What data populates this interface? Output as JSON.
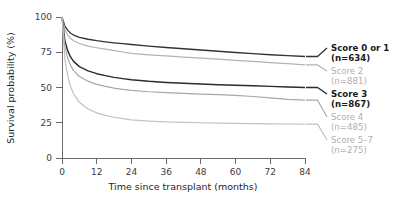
{
  "chart_data": {
    "type": "line",
    "title": "",
    "xlabel": "Time since transplant (months)",
    "ylabel": "Survival probability (%)",
    "xlim": [
      0,
      84
    ],
    "ylim": [
      0,
      100
    ],
    "xticks": [
      "0",
      "12",
      "24",
      "36",
      "48",
      "60",
      "72",
      "84"
    ],
    "yticks": [
      "100",
      "75",
      "50",
      "25",
      "0"
    ],
    "grid": false,
    "legend_position": "right-inline",
    "x": [
      0,
      1,
      2,
      3,
      4,
      6,
      9,
      12,
      15,
      18,
      21,
      24,
      30,
      36,
      42,
      48,
      54,
      60,
      66,
      72,
      78,
      84
    ],
    "series": [
      {
        "name": "Score 0 or 1",
        "label": "Score 0 or 1",
        "n_label": "(n=634)",
        "n": 634,
        "color": "#333333",
        "width": 1.35,
        "values": [
          100,
          93.5,
          90.5,
          88.5,
          87.2,
          85.6,
          84.2,
          83.2,
          82.4,
          81.7,
          81.1,
          80.5,
          79.4,
          78.4,
          77.5,
          76.6,
          75.7,
          74.8,
          74.0,
          73.2,
          72.6,
          72.0
        ]
      },
      {
        "name": "Score 2",
        "label": "Score 2",
        "n_label": "(n=881)",
        "n": 881,
        "color": "#b3b3b3",
        "width": 1.2,
        "values": [
          100,
          91.0,
          87.2,
          84.8,
          83.2,
          81.2,
          79.4,
          78.2,
          77.2,
          76.2,
          75.2,
          74.2,
          73.2,
          72.4,
          71.6,
          70.9,
          70.1,
          69.3,
          68.5,
          67.7,
          66.9,
          66.0
        ]
      },
      {
        "name": "Score 3",
        "label": "Score 3",
        "n_label": "(n=867)",
        "n": 867,
        "color": "#2b2b2b",
        "width": 1.45,
        "values": [
          100,
          83.0,
          76.0,
          71.5,
          68.5,
          64.8,
          61.8,
          59.8,
          58.4,
          57.2,
          56.3,
          55.5,
          54.4,
          53.6,
          53.0,
          52.5,
          52.0,
          51.6,
          51.2,
          50.8,
          50.4,
          50.0
        ]
      },
      {
        "name": "Score 4",
        "label": "Score 4",
        "n_label": "(n=485)",
        "n": 485,
        "color": "#a8a8a8",
        "width": 1.2,
        "values": [
          100,
          79.0,
          70.5,
          65.5,
          62.0,
          57.8,
          54.5,
          52.2,
          50.8,
          49.6,
          48.7,
          48.0,
          47.0,
          46.3,
          45.8,
          45.3,
          44.9,
          44.4,
          43.6,
          42.6,
          41.6,
          41.0
        ]
      },
      {
        "name": "Score 5–7",
        "label": "Score 5–7",
        "n_label": "(n=275)",
        "n": 275,
        "color": "#c2c2c2",
        "width": 1.2,
        "values": [
          100,
          70.0,
          58.0,
          50.5,
          45.5,
          39.5,
          34.8,
          32.0,
          30.2,
          28.9,
          27.9,
          27.0,
          26.2,
          25.6,
          25.3,
          25.0,
          24.8,
          24.6,
          24.4,
          24.2,
          24.1,
          24.0
        ]
      }
    ],
    "series_labels": [
      {
        "label": "Score 0 or 1",
        "n_label": "(n=634)",
        "style": "dark"
      },
      {
        "label": "Score 2",
        "n_label": "(n=881)",
        "style": "light"
      },
      {
        "label": "Score 3",
        "n_label": "(n=867)",
        "style": "dark"
      },
      {
        "label": "Score 4",
        "n_label": "(n=485)",
        "style": "light"
      },
      {
        "label": "Score 5–7",
        "n_label": "(n=275)",
        "style": "light"
      }
    ]
  }
}
